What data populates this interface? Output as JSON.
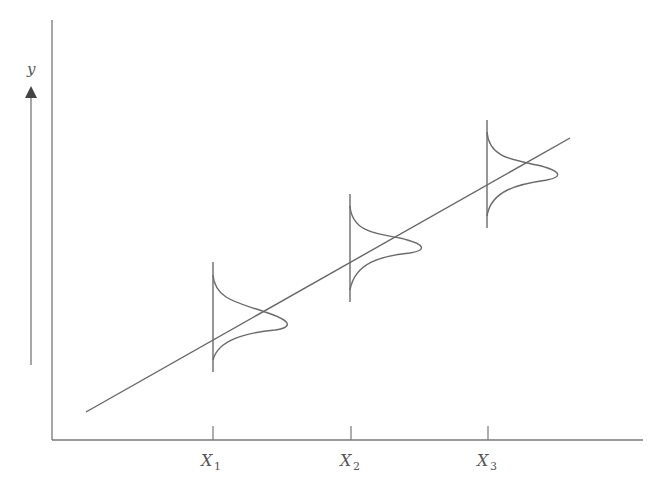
{
  "diagram": {
    "title": "",
    "colors": {
      "line": "#6b6b6b",
      "text": "#555555",
      "background": "#ffffff"
    },
    "y_axis": {
      "label": "y",
      "arrow": "up-arrow-icon"
    },
    "x_axis": {
      "ticks": [
        {
          "label": "X",
          "sub": "1"
        },
        {
          "label": "X",
          "sub": "2"
        },
        {
          "label": "X",
          "sub": "3"
        }
      ]
    },
    "distributions": [
      {
        "at": "X1",
        "shape": "normal-curve"
      },
      {
        "at": "X2",
        "shape": "normal-curve"
      },
      {
        "at": "X3",
        "shape": "normal-curve"
      }
    ]
  }
}
